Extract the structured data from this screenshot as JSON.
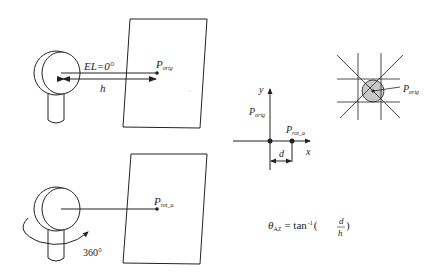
{
  "panels": {
    "top": {
      "elevation_label": "EL=0°",
      "distance_label": "h",
      "point_label": "P",
      "point_subscript": "orig"
    },
    "bottom": {
      "rotation_label": "360°",
      "point_label": "P",
      "point_subscript": "rot_a"
    },
    "axes": {
      "y_label": "y",
      "x_label": "x",
      "orig_label": "P",
      "orig_subscript": "orig",
      "rot_label": "P",
      "rot_subscript": "rot_a",
      "offset_label": "d"
    },
    "grid": {
      "point_label": "P",
      "point_subscript": "orig"
    },
    "formula": {
      "theta": "θ",
      "theta_subscript": "AZ",
      "equals": "= tan",
      "exponent": "-1",
      "open": "(",
      "numerator": "d",
      "denominator": "h",
      "close": ")"
    }
  },
  "colors": {
    "stroke": "#222222",
    "disc_fill": "#c8c8c8"
  }
}
